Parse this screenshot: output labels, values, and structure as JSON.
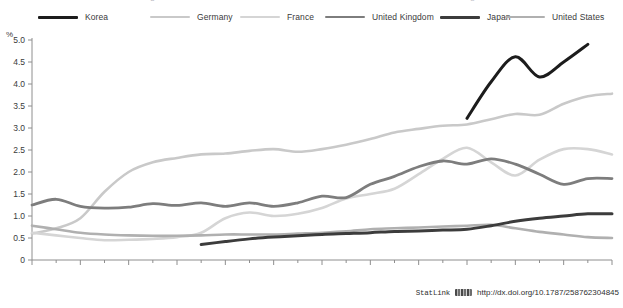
{
  "legend": {
    "items": [
      {
        "label": "Korea",
        "color": "#1c1c1c",
        "width": 3.0
      },
      {
        "label": "Germany",
        "color": "#c9c9c9",
        "width": 2.6
      },
      {
        "label": "France",
        "color": "#d5d5d5",
        "width": 2.6
      },
      {
        "label": "United Kingdom",
        "color": "#7d7d7d",
        "width": 2.8
      },
      {
        "label": "Japan",
        "color": "#3c3c3c",
        "width": 3.0
      },
      {
        "label": "United States",
        "color": "#b0b0b0",
        "width": 2.6
      }
    ]
  },
  "axis": {
    "y_unit": "%",
    "y_ticks": [
      "0",
      "0.5",
      "1.0",
      "1.5",
      "2.0",
      "2.5",
      "3.0",
      "3.5",
      "4.0",
      "4.5",
      "5.0"
    ],
    "x_ticks": [
      "1981",
      "1983",
      "1985",
      "1987",
      "1989",
      "1991",
      "1993",
      "1995",
      "1997",
      "1999",
      "2001",
      "2003",
      "2005"
    ]
  },
  "footer": {
    "statlink_label": "StatLink",
    "statlink_icon": "barcode-icon",
    "url": "http://dx.doi.org/10.1787/258762304845"
  },
  "clipped_title_ghost": {
    "left": "g",
    "right": "g"
  },
  "chart_data": {
    "type": "line",
    "title": "",
    "xlabel": "",
    "ylabel": "%",
    "xlim": [
      1981,
      2005
    ],
    "ylim": [
      0,
      5.0
    ],
    "grid": false,
    "legend_position": "top",
    "x": [
      1981,
      1982,
      1983,
      1984,
      1985,
      1986,
      1987,
      1988,
      1989,
      1990,
      1991,
      1992,
      1993,
      1994,
      1995,
      1996,
      1997,
      1998,
      1999,
      2000,
      2001,
      2002,
      2003,
      2004,
      2005
    ],
    "series": [
      {
        "name": "Korea",
        "color": "#1c1c1c",
        "x": [
          1999,
          2000,
          2001,
          2002,
          2003,
          2004
        ],
        "values": [
          3.22,
          4.05,
          4.62,
          4.16,
          4.5,
          4.9
        ]
      },
      {
        "name": "Germany",
        "color": "#c9c9c9",
        "x": [
          1981,
          1982,
          1983,
          1984,
          1985,
          1986,
          1987,
          1988,
          1989,
          1990,
          1991,
          1992,
          1993,
          1994,
          1995,
          1996,
          1997,
          1998,
          1999,
          2000,
          2001,
          2002,
          2003,
          2004,
          2005
        ],
        "values": [
          0.6,
          0.72,
          0.95,
          1.55,
          2.0,
          2.22,
          2.32,
          2.4,
          2.42,
          2.48,
          2.52,
          2.46,
          2.52,
          2.62,
          2.75,
          2.9,
          2.98,
          3.05,
          3.08,
          3.2,
          3.32,
          3.3,
          3.55,
          3.72,
          3.78
        ]
      },
      {
        "name": "France",
        "color": "#d5d5d5",
        "x": [
          1981,
          1982,
          1983,
          1984,
          1985,
          1986,
          1987,
          1988,
          1989,
          1990,
          1991,
          1992,
          1993,
          1994,
          1995,
          1996,
          1997,
          1998,
          1999,
          2000,
          2001,
          2002,
          2003,
          2004,
          2005
        ],
        "values": [
          0.62,
          0.56,
          0.5,
          0.45,
          0.46,
          0.48,
          0.52,
          0.62,
          0.95,
          1.08,
          1.0,
          1.05,
          1.18,
          1.4,
          1.5,
          1.62,
          1.95,
          2.3,
          2.55,
          2.22,
          1.92,
          2.28,
          2.52,
          2.52,
          2.4
        ]
      },
      {
        "name": "United Kingdom",
        "color": "#7d7d7d",
        "x": [
          1981,
          1982,
          1983,
          1984,
          1985,
          1986,
          1987,
          1988,
          1989,
          1990,
          1991,
          1992,
          1993,
          1994,
          1995,
          1996,
          1997,
          1998,
          1999,
          2000,
          2001,
          2002,
          2003,
          2004,
          2005
        ],
        "values": [
          1.25,
          1.38,
          1.22,
          1.18,
          1.2,
          1.28,
          1.24,
          1.3,
          1.22,
          1.3,
          1.22,
          1.3,
          1.45,
          1.42,
          1.72,
          1.9,
          2.12,
          2.25,
          2.18,
          2.3,
          2.18,
          1.95,
          1.72,
          1.85,
          1.85
        ]
      },
      {
        "name": "Japan",
        "color": "#3c3c3c",
        "x": [
          1988,
          1989,
          1990,
          1991,
          1992,
          1993,
          1994,
          1995,
          1996,
          1997,
          1998,
          1999,
          2000,
          2001,
          2002,
          2003,
          2004,
          2005
        ],
        "values": [
          0.35,
          0.42,
          0.48,
          0.52,
          0.55,
          0.58,
          0.6,
          0.62,
          0.65,
          0.66,
          0.68,
          0.7,
          0.78,
          0.88,
          0.95,
          1.0,
          1.05,
          1.05
        ]
      },
      {
        "name": "United States",
        "color": "#b0b0b0",
        "x": [
          1981,
          1982,
          1983,
          1984,
          1985,
          1986,
          1987,
          1988,
          1989,
          1990,
          1991,
          1992,
          1993,
          1994,
          1995,
          1996,
          1997,
          1998,
          1999,
          2000,
          2001,
          2002,
          2003,
          2004,
          2005
        ],
        "values": [
          0.78,
          0.7,
          0.62,
          0.58,
          0.56,
          0.55,
          0.55,
          0.56,
          0.58,
          0.58,
          0.58,
          0.6,
          0.62,
          0.65,
          0.7,
          0.72,
          0.74,
          0.76,
          0.78,
          0.8,
          0.72,
          0.64,
          0.58,
          0.52,
          0.5
        ]
      }
    ]
  }
}
